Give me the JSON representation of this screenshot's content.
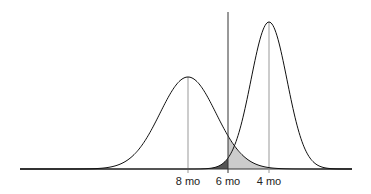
{
  "chart_data": {
    "type": "area",
    "title": "",
    "curves": [
      {
        "name": "left-distribution",
        "peak_label": "8 mo",
        "peak_x": 188,
        "sd_px": 28,
        "height_px": 92
      },
      {
        "name": "right-distribution",
        "peak_label": "4 mo",
        "peak_x": 269,
        "sd_px": 18,
        "height_px": 147
      }
    ],
    "threshold": {
      "label": "6 mo",
      "x": 228
    },
    "shaded_regions": [
      {
        "name": "right-curve-below-threshold",
        "color": "#555555"
      },
      {
        "name": "left-curve-above-threshold",
        "color": "#cccccc"
      }
    ],
    "tick_labels": [
      "8 mo",
      "6 mo",
      "4 mo"
    ]
  },
  "labels": {
    "left": "8 mo",
    "mid": "6 mo",
    "right": "4 mo"
  }
}
